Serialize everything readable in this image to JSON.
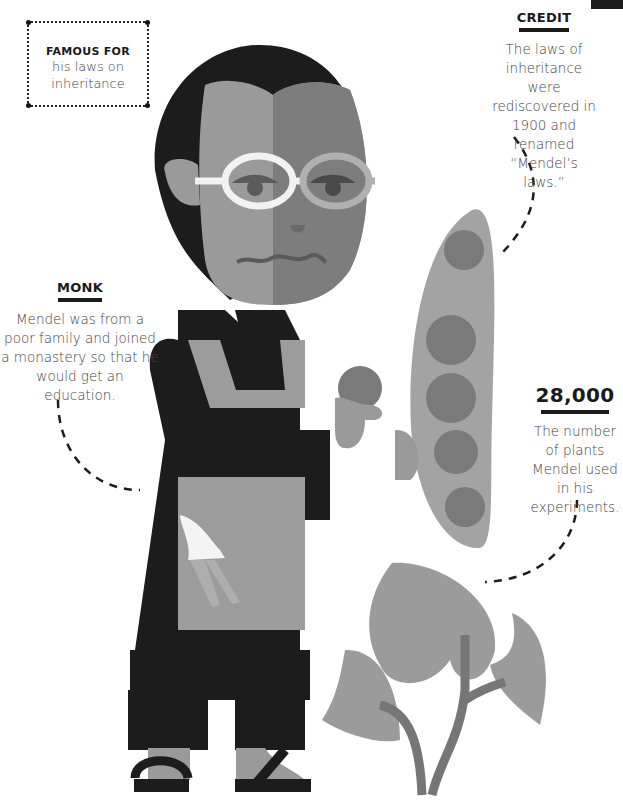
{
  "famous_for": {
    "heading": "FAMOUS FOR",
    "text": "his laws on inheritance"
  },
  "credit": {
    "heading": "CREDIT",
    "text": "The laws of inheritance were rediscovered in 1900 and renamed “Mendel’s laws.”"
  },
  "monk": {
    "heading": "MONK",
    "text": "Mendel was from a poor family and joined a monastery so that he would get an education."
  },
  "stat": {
    "heading": "28,000",
    "text": "The number of plants Mendel used in his experiments."
  },
  "colors": {
    "black": "#1c1c1c",
    "skin_light": "#9a9a9a",
    "skin_dark": "#7d7d7d",
    "apron": "#9c9c9c",
    "pea_pod": "#a3a3a3",
    "pea": "#7a7a7a",
    "leaf": "#9b9b9b",
    "stem": "#767676"
  },
  "illustration": {
    "subject": "Gregor Mendel holding a pea and a pea pod beside a plant",
    "icons": [
      "pea-pod-icon",
      "pea-plant-icon",
      "glasses-icon",
      "sandals-icon"
    ]
  }
}
